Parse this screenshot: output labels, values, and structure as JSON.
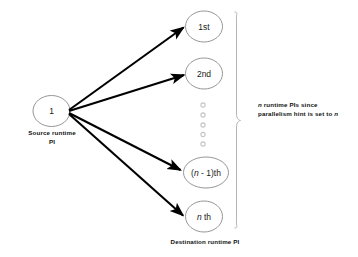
{
  "diagram": {
    "title_present": false,
    "background_color": "#ffffff",
    "stroke_color": "#777777",
    "arrow_color": "#000000",
    "dot_color": "#c8c8c8",
    "source_node": {
      "label": "1",
      "caption_line1": "Source runtime",
      "caption_line2": "PI"
    },
    "destination_nodes": [
      {
        "id": "node-1st",
        "label": "1st"
      },
      {
        "id": "node-2nd",
        "label": "2nd"
      },
      {
        "id": "node-n-minus-1th",
        "label_prefix": "(",
        "label_italic": "n",
        "label_suffix": " - 1)th"
      },
      {
        "id": "node-nth",
        "label_italic": "n",
        "label_suffix": " th"
      }
    ],
    "ellipsis_dots": 5,
    "destination_caption": "Destination runtime PI",
    "brace_caption": {
      "line1_italic": "n",
      "line1_rest": " runtime PIs since",
      "line2": "parallelism hint is set to ",
      "line2_italic": "n"
    },
    "arrow_count": 4
  }
}
